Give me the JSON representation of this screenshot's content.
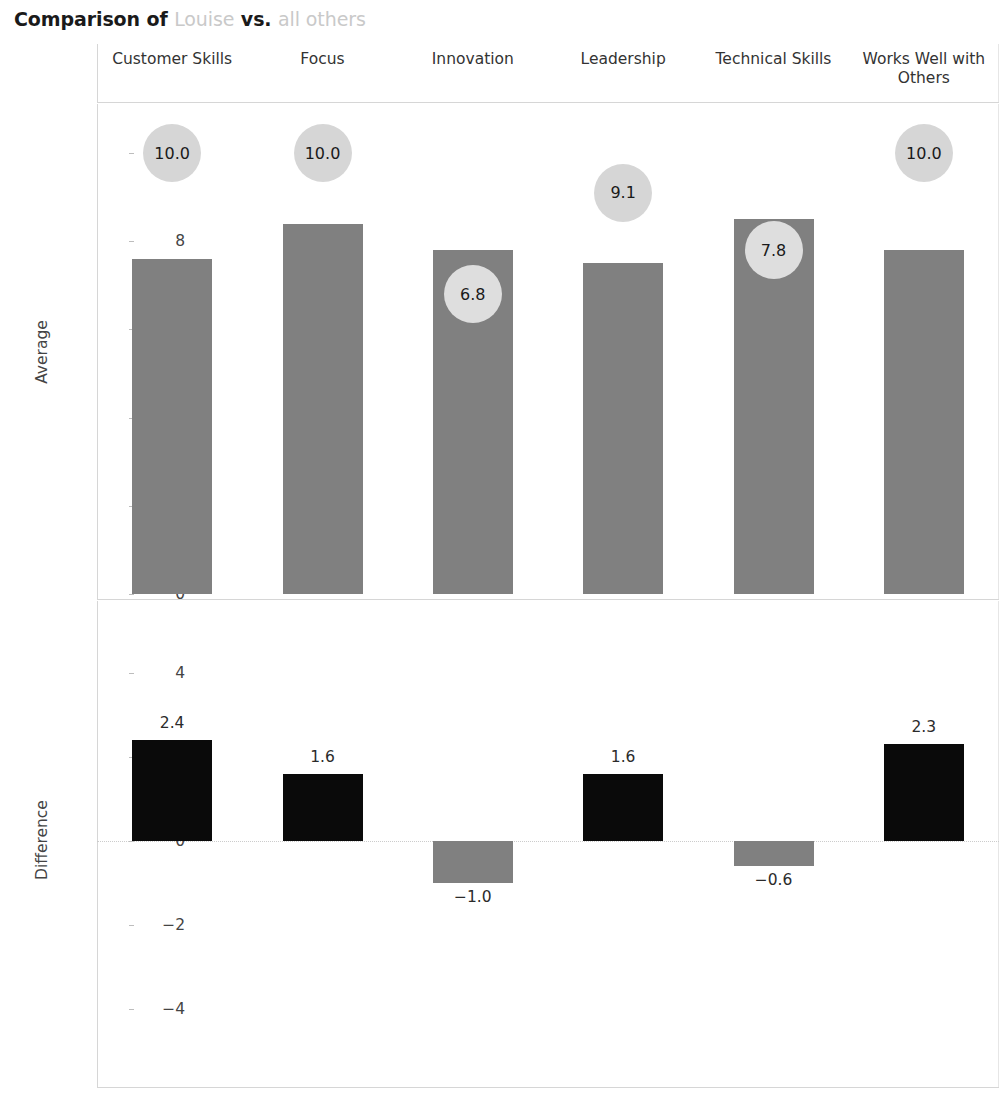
{
  "title": {
    "prefix": "Comparison of",
    "subject": "Louise",
    "middle": "vs.",
    "comparison": "all others",
    "full": "Comparison of Louise vs. all others"
  },
  "colors": {
    "bar_average": "#808080",
    "bar_positive": "#0a0a0a",
    "bar_negative": "#808080",
    "bubble": "#d6d6d6",
    "axis": "#d6d6d6",
    "text": "#333333",
    "muted_text": "#c9c9c9"
  },
  "chart_data": {
    "type": "bar",
    "title": "Comparison of Louise vs. all others",
    "categories": [
      "Customer Skills",
      "Focus",
      "Innovation",
      "Leadership",
      "Technical Skills",
      "Works Well with Others"
    ],
    "panels": [
      {
        "id": "average",
        "ylabel": "Average",
        "ylim": [
          0,
          11
        ],
        "yticks": [
          0,
          2,
          4,
          6,
          8,
          10
        ],
        "ytick_labels": [
          "0",
          "2",
          "4",
          "6",
          "8",
          "10"
        ],
        "grid": false,
        "series": [
          {
            "name": "Average (all others)",
            "mark": "bar",
            "values": [
              7.6,
              8.4,
              7.8,
              7.5,
              8.5,
              7.8
            ]
          },
          {
            "name": "Louise",
            "mark": "bubble",
            "values": [
              10.0,
              10.0,
              6.8,
              9.1,
              7.8,
              10.0
            ],
            "labels": [
              "10.0",
              "10.0",
              "6.8",
              "9.1",
              "7.8",
              "10.0"
            ]
          }
        ]
      },
      {
        "id": "difference",
        "ylabel": "Difference",
        "ylim": [
          -5.2,
          5.0
        ],
        "yticks": [
          -4,
          -2,
          0,
          2,
          4
        ],
        "ytick_labels": [
          "−4",
          "−2",
          "0",
          "2",
          "4"
        ],
        "grid": false,
        "zero_line": true,
        "series": [
          {
            "name": "Difference",
            "mark": "bar",
            "values": [
              2.4,
              1.6,
              -1.0,
              1.6,
              -0.6,
              2.3
            ],
            "labels": [
              "2.4",
              "1.6",
              "−1.0",
              "1.6",
              "−0.6",
              "2.3"
            ]
          }
        ]
      }
    ]
  }
}
